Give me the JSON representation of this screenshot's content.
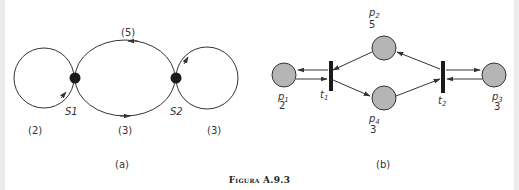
{
  "figure": {
    "caption_prefix": "Figura",
    "caption_number": "A.9.3",
    "panels": {
      "a": {
        "label": "(a)",
        "nodes": [
          {
            "id": "S1",
            "label": "S1"
          },
          {
            "id": "S2",
            "label": "S2"
          }
        ],
        "loops": [
          {
            "name": "left-loop",
            "weight": "(2)"
          },
          {
            "name": "top-arc",
            "weight": "(5)"
          },
          {
            "name": "bottom-arc",
            "weight": "(3)"
          },
          {
            "name": "right-loop",
            "weight": "(3)"
          }
        ]
      },
      "b": {
        "label": "(b)",
        "places": [
          {
            "id": "p1",
            "name": "p",
            "sub": "1",
            "tokens": "2"
          },
          {
            "id": "p2",
            "name": "p",
            "sub": "2",
            "tokens": "5"
          },
          {
            "id": "p3",
            "name": "p",
            "sub": "3",
            "tokens": "3"
          },
          {
            "id": "p4",
            "name": "p",
            "sub": "4",
            "tokens": "3"
          }
        ],
        "transitions": [
          {
            "id": "t1",
            "name": "t",
            "sub": "1"
          },
          {
            "id": "t2",
            "name": "t",
            "sub": "2"
          }
        ]
      }
    },
    "colors": {
      "stroke": "#333333",
      "place_fill": "#b5b5b5",
      "node_fill": "#1a1a1a"
    }
  }
}
